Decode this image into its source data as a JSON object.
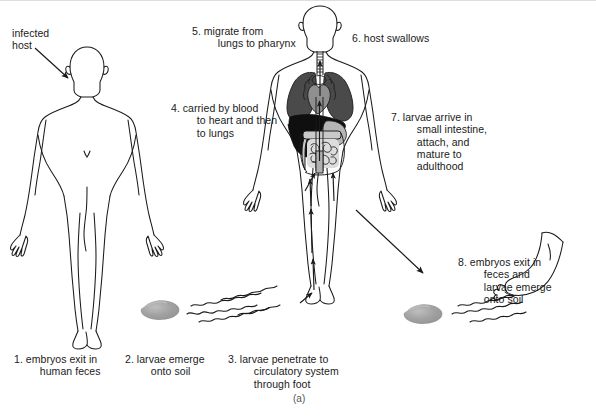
{
  "figure": {
    "caption": "(a)",
    "title_alt": "Hookworm life cycle diagram",
    "colors": {
      "outline": "#1a1a1a",
      "text": "#1a1a1a",
      "lung": "#4d4d4d",
      "liver": "#0d0d0d",
      "heart": "#8c8c8c",
      "stomach": "#b3b3b3",
      "intestine": "#cccccc",
      "soil_blob": "#9a9a9a",
      "background": "#ffffff"
    }
  },
  "annotations": {
    "infected_host": "infected\nhost"
  },
  "steps": [
    {
      "id": "step-1",
      "number": "1.",
      "text": "1. embryos exit in\n     human feces"
    },
    {
      "id": "step-2",
      "number": "2.",
      "text": "2. larvae emerge\n     onto soil"
    },
    {
      "id": "step-3",
      "number": "3.",
      "text": "3. larvae penetrate to\n     circulatory system\n     through foot"
    },
    {
      "id": "step-4",
      "number": "4.",
      "text": "4. carried by blood\n     to heart and then\n     to lungs"
    },
    {
      "id": "step-5",
      "number": "5.",
      "text": "5. migrate from\n     lungs to pharynx"
    },
    {
      "id": "step-6",
      "number": "6.",
      "text": "6. host swallows"
    },
    {
      "id": "step-7",
      "number": "7.",
      "text": "7. larvae arrive in\n     small intestine,\n     attach, and\n     mature to\n     adulthood"
    },
    {
      "id": "step-8",
      "number": "8.",
      "text": "8. embryos exit in\n     feces and\n     larvae emerge\n     onto soil"
    }
  ],
  "organs": [
    {
      "name": "trachea"
    },
    {
      "name": "right-lung"
    },
    {
      "name": "left-lung"
    },
    {
      "name": "heart"
    },
    {
      "name": "liver"
    },
    {
      "name": "stomach"
    },
    {
      "name": "small-intestine"
    },
    {
      "name": "large-intestine"
    }
  ],
  "scene_objects": [
    {
      "name": "infected-host-figure"
    },
    {
      "name": "infected-host-arrow"
    },
    {
      "name": "soil-feces-blob-left"
    },
    {
      "name": "larvae-trail-left"
    },
    {
      "name": "anatomical-figure"
    },
    {
      "name": "circulatory-path-arrows"
    },
    {
      "name": "exit-arrow-to-step8"
    },
    {
      "name": "soil-feces-blob-right"
    },
    {
      "name": "larvae-trail-right"
    },
    {
      "name": "bare-foot"
    }
  ]
}
